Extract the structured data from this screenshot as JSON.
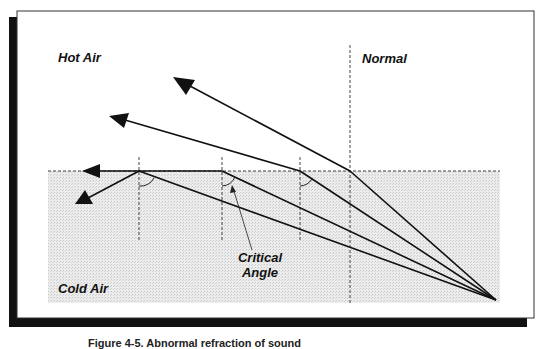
{
  "diagram": {
    "type": "refraction-critical-angle",
    "labels": {
      "hot_air": "Hot Air",
      "normal": "Normal",
      "critical_angle_line1": "Critical",
      "critical_angle_line2": "Angle",
      "cold_air": "Cold Air"
    },
    "caption": "Figure 4-5. Abnormal refraction of sound",
    "colors": {
      "frame_border": "#333333",
      "shadow": "#111111",
      "cold_air_fill": "#e4e4e4",
      "line": "#111111",
      "dash": "#444444"
    },
    "rays": [
      {
        "name": "ray-1",
        "source": [
          496,
          300
        ],
        "refraction_point": [
          350,
          171
        ],
        "end": [
          178,
          80
        ]
      },
      {
        "name": "ray-2",
        "source": [
          496,
          300
        ],
        "refraction_point": [
          300,
          171
        ],
        "end": [
          112,
          117
        ]
      },
      {
        "name": "ray-3-critical",
        "source": [
          496,
          300
        ],
        "refraction_point": [
          222,
          171
        ],
        "end": [
          82,
          171
        ]
      },
      {
        "name": "ray-4-reflected",
        "source": [
          496,
          300
        ],
        "refraction_point": [
          139,
          171
        ],
        "end": [
          76,
          204
        ]
      }
    ]
  }
}
